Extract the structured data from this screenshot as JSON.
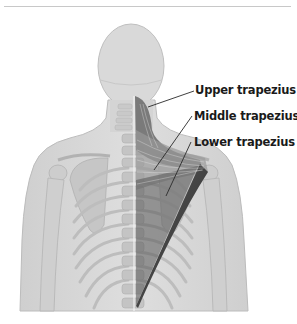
{
  "figure": {
    "labels": [
      {
        "id": "upper",
        "text": "Upper trapezius"
      },
      {
        "id": "middle",
        "text": "Middle trapezius"
      },
      {
        "id": "lower",
        "text": "Lower trapezius"
      }
    ]
  },
  "colors": {
    "skeleton": "#d6d6d6",
    "body_outline": "#bdbdbd",
    "muscle": "#4a4a4a",
    "divider": "#c8c8c8",
    "label_text": "#1a1a1a"
  }
}
